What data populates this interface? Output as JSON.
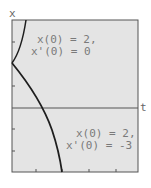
{
  "figure": {
    "y_axis_label": "x",
    "x_axis_label": "t",
    "colors": {
      "panel_bg": "#e4e4e4",
      "frame": "#555555",
      "curve": "#1e1e1e",
      "annotation_text": "#7a7a7a"
    },
    "annotations": [
      {
        "line1": "x(0) = 2,",
        "line2": "x'(0) = 0"
      },
      {
        "line1": "x(0) = 2,",
        "line2": "x'(0) = -3"
      }
    ],
    "curves": [
      {
        "name": "solution-x'(0)=0",
        "description": "curve from left edge at x=2 rising to top of frame"
      },
      {
        "name": "solution-x'(0)=-3",
        "description": "curve from left edge at x=2 descending through t-axis to bottom of frame"
      }
    ]
  }
}
